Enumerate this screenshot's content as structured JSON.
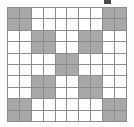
{
  "figure": {
    "title": "",
    "kind": "binary-grid",
    "rows": 10,
    "cols": 10,
    "cell_on_color": "#a8a8a8",
    "cell_off_color": "#ffffff",
    "gridline_color": "#8c8c8c",
    "background_color": "#ffffff",
    "mark_color": "#4a4a4a"
  },
  "chart_data": {
    "type": "heatmap",
    "title": "",
    "xlabel": "",
    "ylabel": "",
    "legend": [],
    "grid": true,
    "x": [
      1,
      2,
      3,
      4,
      5,
      6,
      7,
      8,
      9,
      10
    ],
    "y": [
      1,
      2,
      3,
      4,
      5,
      6,
      7,
      8,
      9,
      10
    ],
    "xlim": [
      1,
      10
    ],
    "ylim": [
      1,
      10
    ],
    "value_labels": {
      "0": "empty",
      "1": "filled"
    },
    "values": [
      [
        1,
        1,
        0,
        0,
        0,
        0,
        0,
        0,
        1,
        1
      ],
      [
        1,
        1,
        0,
        0,
        0,
        0,
        0,
        0,
        1,
        1
      ],
      [
        0,
        0,
        1,
        1,
        0,
        0,
        1,
        1,
        0,
        0
      ],
      [
        0,
        0,
        1,
        1,
        0,
        0,
        1,
        1,
        0,
        0
      ],
      [
        0,
        0,
        0,
        0,
        1,
        1,
        0,
        0,
        0,
        0
      ],
      [
        0,
        0,
        0,
        0,
        1,
        1,
        0,
        0,
        0,
        0
      ],
      [
        0,
        0,
        1,
        1,
        0,
        0,
        1,
        1,
        0,
        0
      ],
      [
        0,
        0,
        1,
        1,
        0,
        0,
        1,
        1,
        0,
        0
      ],
      [
        1,
        1,
        0,
        0,
        0,
        0,
        0,
        0,
        1,
        1
      ],
      [
        1,
        1,
        0,
        0,
        0,
        0,
        0,
        0,
        1,
        1
      ]
    ]
  },
  "marks": [
    {
      "name": "top-tick-mark",
      "x": 104,
      "y": 0,
      "width": 7,
      "height": 4
    }
  ]
}
